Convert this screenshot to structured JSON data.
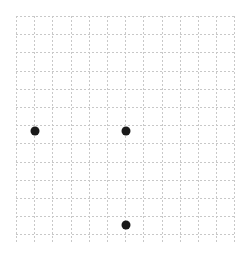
{
  "grid": {
    "left": 16,
    "top": 16,
    "cell": 18.2,
    "cols": 12,
    "rows": 12.5,
    "line_color": "#c8c8c8"
  },
  "points": [
    {
      "x": 35,
      "y": 131,
      "r": 4.5,
      "color": "#1a1a1a"
    },
    {
      "x": 126,
      "y": 131,
      "r": 4.5,
      "color": "#1a1a1a"
    },
    {
      "x": 126,
      "y": 225,
      "r": 4.5,
      "color": "#1a1a1a"
    }
  ]
}
